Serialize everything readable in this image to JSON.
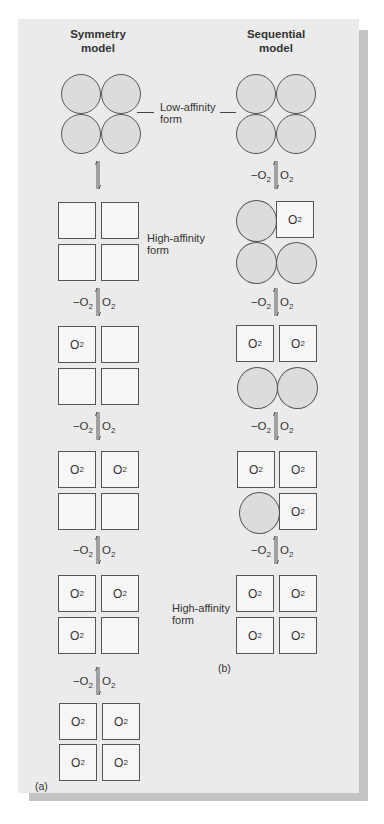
{
  "figure": {
    "panel_bg": "#ebebeb",
    "shadow_color": "#c4c4c4",
    "subunit_circle_color": "#dcdcdc",
    "subunit_square_color": "#f6f6f6"
  },
  "symmetry": {
    "title_line1": "Symmetry",
    "title_line2": "model",
    "caption": "(a)",
    "high_affinity_label_line1": "High-affinity",
    "high_affinity_label_line2": "form",
    "arrows": [
      {
        "left": "",
        "right": ""
      },
      {
        "left": "−O",
        "left_sub": "2",
        "right": "O",
        "right_sub": "2"
      },
      {
        "left": "−O",
        "left_sub": "2",
        "right": "O",
        "right_sub": "2"
      },
      {
        "left": "−O",
        "left_sub": "2",
        "right": "O",
        "right_sub": "2"
      },
      {
        "left": "−O",
        "left_sub": "2",
        "right": "O",
        "right_sub": "2"
      }
    ],
    "states": [
      {
        "shape": "circles",
        "o2": [
          false,
          false,
          false,
          false
        ]
      },
      {
        "shape": "squares",
        "o2": [
          false,
          false,
          false,
          false
        ]
      },
      {
        "shape": "squares",
        "o2": [
          true,
          false,
          false,
          false
        ]
      },
      {
        "shape": "squares",
        "o2": [
          true,
          true,
          false,
          false
        ]
      },
      {
        "shape": "squares",
        "o2": [
          true,
          true,
          true,
          false
        ]
      },
      {
        "shape": "squares",
        "o2": [
          true,
          true,
          true,
          true
        ]
      }
    ]
  },
  "sequential": {
    "title_line1": "Sequential",
    "title_line2": "model",
    "caption": "(b)",
    "high_affinity_label_line1": "High-affinity",
    "high_affinity_label_line2": "form",
    "arrows": [
      {
        "left": "−O",
        "left_sub": "2",
        "right": "O",
        "right_sub": "2"
      },
      {
        "left": "−O",
        "left_sub": "2",
        "right": "O",
        "right_sub": "2"
      },
      {
        "left": "−O",
        "left_sub": "2",
        "right": "O",
        "right_sub": "2"
      },
      {
        "left": "−O",
        "left_sub": "2",
        "right": "O",
        "right_sub": "2"
      }
    ],
    "states": [
      {
        "subunits": [
          "circle",
          "circle",
          "circle",
          "circle"
        ]
      },
      {
        "subunits": [
          "circle",
          "square-O2",
          "circle",
          "circle"
        ]
      },
      {
        "subunits": [
          "square-O2",
          "square-O2",
          "circle",
          "circle"
        ]
      },
      {
        "subunits": [
          "square-O2",
          "square-O2",
          "circle",
          "square-O2"
        ]
      },
      {
        "subunits": [
          "square-O2",
          "square-O2",
          "square-O2",
          "square-O2"
        ]
      }
    ]
  },
  "shared": {
    "low_affinity_label_line1": "Low-affinity",
    "low_affinity_label_line2": "form",
    "o2_text": "O",
    "o2_sub": "2"
  }
}
